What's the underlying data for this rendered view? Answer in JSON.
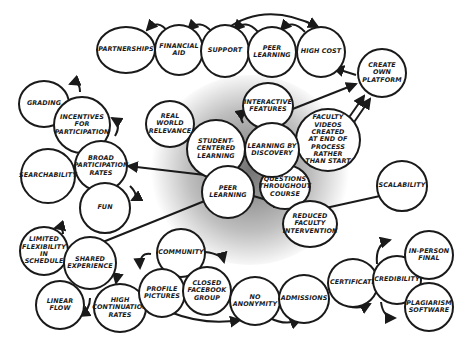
{
  "diagram": {
    "type": "concept-map",
    "style": "hand-drawn circles",
    "colors": {
      "stroke": "#1a1a1a",
      "fill": "#ffffff",
      "background": "#ffffff",
      "glow": "#000000"
    },
    "nodes": [
      {
        "id": "partnerships",
        "label": "PARTNERSHIPS"
      },
      {
        "id": "financial_aid",
        "label": "FINANCIAL\nAID"
      },
      {
        "id": "support",
        "label": "SUPPORT"
      },
      {
        "id": "peer_learning_top",
        "label": "PEER\nLEARNING"
      },
      {
        "id": "high_cost",
        "label": "HIGH COST"
      },
      {
        "id": "create_own_platform",
        "label": "CREATE\nOWN\nPLATFORM"
      },
      {
        "id": "grading",
        "label": "GRADING"
      },
      {
        "id": "incentives",
        "label": "INCENTIVES\nFOR\nPARTICIPATION"
      },
      {
        "id": "broad_participation",
        "label": "BROAD\nPARTICIPATION\nRATES"
      },
      {
        "id": "searchability",
        "label": "SEARCHABILITY"
      },
      {
        "id": "fun",
        "label": "FUN"
      },
      {
        "id": "real_world",
        "label": "REAL\nWORLD\nRELEVANCE"
      },
      {
        "id": "student_centered",
        "label": "STUDENT-\nCENTERED\nLEARNING"
      },
      {
        "id": "learning_discovery",
        "label": "LEARNING BY\nDISCOVERY"
      },
      {
        "id": "interactive",
        "label": "INTERACTIVE\nFEATURES"
      },
      {
        "id": "faculty_videos",
        "label": "FACULTY\nVIDEOS CREATED\nAT END OF\nPROCESS\nRATHER\nTHAN START"
      },
      {
        "id": "questions",
        "label": "QUESTIONS\nTHROUGHOUT\nCOURSE"
      },
      {
        "id": "peer_learning_center",
        "label": "PEER\nLEARNING"
      },
      {
        "id": "scalability",
        "label": "SCALABILITY"
      },
      {
        "id": "reduced_faculty",
        "label": "REDUCED\nFACULTY\nINTERVENTION"
      },
      {
        "id": "limited_flex",
        "label": "LIMITED\nFLEXIBILITY\nIN\nSCHEDULE"
      },
      {
        "id": "shared_experience",
        "label": "SHARED\nEXPERIENCE"
      },
      {
        "id": "linear_flow",
        "label": "LINEAR\nFLOW"
      },
      {
        "id": "high_continuation",
        "label": "HIGH\nCONTINUATION\nRATES"
      },
      {
        "id": "community",
        "label": "COMMUNITY"
      },
      {
        "id": "profile_pictures",
        "label": "PROFILE\nPICTURES"
      },
      {
        "id": "closed_facebook",
        "label": "CLOSED\nFACEBOOK\nGROUP"
      },
      {
        "id": "no_anonymity",
        "label": "NO\nANONYMITY"
      },
      {
        "id": "admissions",
        "label": "ADMISSIONS"
      },
      {
        "id": "certificate",
        "label": "CERTIFICATE"
      },
      {
        "id": "credibility",
        "label": "CREDIBILITY"
      },
      {
        "id": "in_person_final",
        "label": "IN-PERSON\nFINAL"
      },
      {
        "id": "plagiarism",
        "label": "PLAGIARISM\nSOFTWARE"
      }
    ],
    "edges": [
      {
        "from": "financial_aid",
        "to": "partnerships"
      },
      {
        "from": "support",
        "to": "financial_aid"
      },
      {
        "from": "peer_learning_top",
        "to": "support"
      },
      {
        "from": "high_cost",
        "to": "peer_learning_top"
      },
      {
        "from": "support",
        "to": "high_cost"
      },
      {
        "from": "create_own_platform",
        "to": "high_cost"
      },
      {
        "from": "interactive",
        "to": "create_own_platform"
      },
      {
        "from": "faculty_videos",
        "to": "create_own_platform"
      },
      {
        "from": "incentives",
        "to": "grading"
      },
      {
        "from": "broad_participation",
        "to": "incentives"
      },
      {
        "from": "broad_participation",
        "to": "searchability"
      },
      {
        "from": "broad_participation",
        "to": "fun"
      },
      {
        "from": "peer_learning_center",
        "to": "broad_participation"
      },
      {
        "from": "learning_discovery",
        "to": "interactive"
      },
      {
        "from": "learning_discovery",
        "to": "faculty_videos"
      },
      {
        "from": "learning_discovery",
        "to": "questions"
      },
      {
        "from": "peer_learning_center",
        "to": "reduced_faculty"
      },
      {
        "from": "scalability",
        "to": "reduced_faculty"
      },
      {
        "from": "peer_learning_center",
        "to": "shared_experience"
      },
      {
        "from": "shared_experience",
        "to": "limited_flex"
      },
      {
        "from": "shared_experience",
        "to": "linear_flow"
      },
      {
        "from": "shared_experience",
        "to": "high_continuation"
      },
      {
        "from": "community",
        "to": "profile_pictures"
      },
      {
        "from": "community",
        "to": "closed_facebook"
      },
      {
        "from": "profile_pictures",
        "to": "no_anonymity"
      },
      {
        "from": "no_anonymity",
        "to": "admissions"
      },
      {
        "from": "admissions",
        "to": "certificate"
      },
      {
        "from": "certificate",
        "to": "credibility"
      },
      {
        "from": "credibility",
        "to": "in_person_final"
      },
      {
        "from": "credibility",
        "to": "plagiarism"
      }
    ]
  }
}
